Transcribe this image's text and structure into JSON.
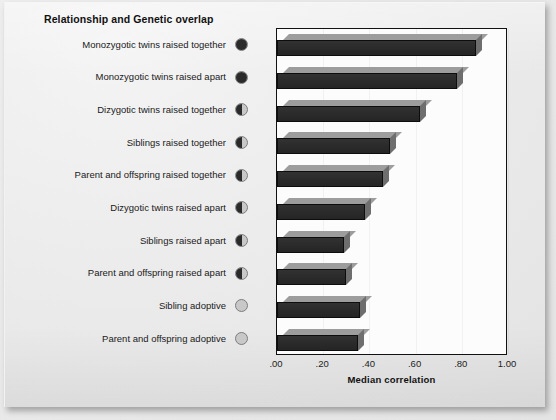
{
  "chart_title": "Relationship and Genetic overlap",
  "axis": {
    "x_title": "Median correlation",
    "tick_labels": [
      ".00",
      ".20",
      ".40",
      ".60",
      ".80",
      "1.00"
    ],
    "tick_values": [
      0.0,
      0.2,
      0.4,
      0.6,
      0.8,
      1.0
    ]
  },
  "colors": {
    "bar_front": "#2a2a2a",
    "bar_top": "#9d9d9d",
    "bar_side": "#6e6e6e",
    "plot_background": "#fcfcfc",
    "page_background": "#ececec",
    "text": "#111111",
    "dot_fill": "#2a2a2a",
    "dot_empty": "#c8c8c8"
  },
  "chart_data": {
    "type": "bar",
    "orientation": "horizontal",
    "title": "Relationship and Genetic overlap",
    "xlabel": "Median correlation",
    "ylabel": "",
    "xlim": [
      0.0,
      1.0
    ],
    "grid": false,
    "legend": "none",
    "categories": [
      "Monozygotic twins raised together",
      "Monozygotic twins raised apart",
      "Dizygotic twins raised together",
      "Siblings raised together",
      "Parent and offspring raised together",
      "Dizygotic twins raised apart",
      "Siblings raised apart",
      "Parent and offspring raised apart",
      "Sibling adoptive",
      "Parent and offspring adoptive"
    ],
    "values": [
      0.86,
      0.78,
      0.62,
      0.49,
      0.46,
      0.38,
      0.29,
      0.3,
      0.36,
      0.35
    ],
    "genetic_overlap": [
      1.0,
      1.0,
      0.5,
      0.5,
      0.5,
      0.5,
      0.5,
      0.5,
      0.0,
      0.0
    ]
  },
  "rows": [
    {
      "label": "Monozygotic twins raised together",
      "value": 0.86,
      "overlap": "full"
    },
    {
      "label": "Monozygotic twins raised apart",
      "value": 0.78,
      "overlap": "full"
    },
    {
      "label": "Dizygotic twins raised together",
      "value": 0.62,
      "overlap": "half"
    },
    {
      "label": "Siblings raised together",
      "value": 0.49,
      "overlap": "half"
    },
    {
      "label": "Parent and offspring raised together",
      "value": 0.46,
      "overlap": "half"
    },
    {
      "label": "Dizygotic twins raised apart",
      "value": 0.38,
      "overlap": "half"
    },
    {
      "label": "Siblings raised apart",
      "value": 0.29,
      "overlap": "half"
    },
    {
      "label": "Parent and offspring raised apart",
      "value": 0.3,
      "overlap": "half"
    },
    {
      "label": "Sibling adoptive",
      "value": 0.36,
      "overlap": "empty"
    },
    {
      "label": "Parent and offspring adoptive",
      "value": 0.35,
      "overlap": "empty"
    }
  ]
}
